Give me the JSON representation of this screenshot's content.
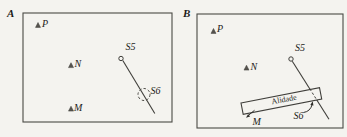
{
  "figure": {
    "panel_a": {
      "label": "A",
      "point_p": "P",
      "point_n": "N",
      "point_m": "M",
      "station_s5": "S5",
      "station_s6": "S6"
    },
    "panel_b": {
      "label": "B",
      "point_p": "P",
      "point_n": "N",
      "point_m": "M",
      "station_s5": "S5",
      "station_s6": "S6",
      "alidade": "Alidade"
    },
    "colors": {
      "background": "#f4f3ef",
      "line": "#3f3e3a",
      "text": "#1c1b18"
    }
  }
}
